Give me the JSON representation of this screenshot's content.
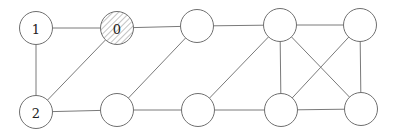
{
  "diagram": {
    "type": "graph",
    "directed": false,
    "node_radius": 16.5,
    "colors": {
      "edge": "#7a7a7a",
      "node_stroke": "#6f6f6f",
      "node_fill": "#ffffff",
      "hatch": "#9a9a9a"
    },
    "nodes": [
      {
        "id": "n1",
        "label": "1",
        "x": 36,
        "y": 28,
        "hatched": false
      },
      {
        "id": "n0",
        "label": "0",
        "x": 117,
        "y": 28,
        "hatched": true
      },
      {
        "id": "t3",
        "label": "",
        "x": 197,
        "y": 26,
        "hatched": false
      },
      {
        "id": "t4",
        "label": "",
        "x": 280,
        "y": 25,
        "hatched": false
      },
      {
        "id": "t5",
        "label": "",
        "x": 360,
        "y": 25,
        "hatched": false
      },
      {
        "id": "n2",
        "label": "2",
        "x": 36,
        "y": 112,
        "hatched": false
      },
      {
        "id": "b1",
        "label": "",
        "x": 117,
        "y": 110,
        "hatched": false
      },
      {
        "id": "b3",
        "label": "",
        "x": 198,
        "y": 110,
        "hatched": false
      },
      {
        "id": "b4",
        "label": "",
        "x": 281,
        "y": 110,
        "hatched": false
      },
      {
        "id": "b5",
        "label": "",
        "x": 361,
        "y": 109,
        "hatched": false
      }
    ],
    "edges": [
      [
        "n1",
        "n0"
      ],
      [
        "n1",
        "n2"
      ],
      [
        "n0",
        "n2"
      ],
      [
        "n0",
        "t3"
      ],
      [
        "n2",
        "b1"
      ],
      [
        "t3",
        "b1"
      ],
      [
        "t3",
        "t4"
      ],
      [
        "b1",
        "b3"
      ],
      [
        "b3",
        "t4"
      ],
      [
        "b3",
        "b4"
      ],
      [
        "t4",
        "t5"
      ],
      [
        "t4",
        "b4"
      ],
      [
        "t4",
        "b5"
      ],
      [
        "t5",
        "b4"
      ],
      [
        "t5",
        "b5"
      ],
      [
        "b4",
        "b5"
      ]
    ]
  }
}
